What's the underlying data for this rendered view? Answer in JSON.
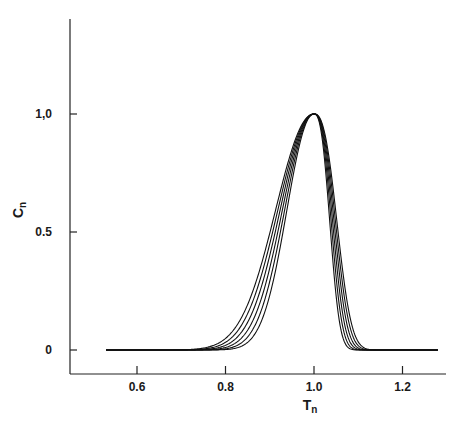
{
  "chart_data": {
    "type": "line",
    "title": "",
    "xlabel": "T",
    "xlabel_sub": "n",
    "ylabel": "C",
    "ylabel_sub": "n",
    "xlim": [
      0.45,
      1.28
    ],
    "ylim": [
      -0.1,
      1.4
    ],
    "grid": false,
    "legend": null,
    "x_ticks": [
      {
        "value": 0.6,
        "label": "0.6"
      },
      {
        "value": 0.8,
        "label": "0.8"
      },
      {
        "value": 1.0,
        "label": "1.0"
      },
      {
        "value": 1.2,
        "label": "1.2"
      }
    ],
    "y_ticks": [
      {
        "value": 0,
        "label": "0"
      },
      {
        "value": 0.5,
        "label": "0.5"
      },
      {
        "value": 1.0,
        "label": "1,0"
      }
    ],
    "x_range_of_curves": [
      0.53,
      1.28
    ],
    "peak": {
      "x": 1.0,
      "y": 1.0
    },
    "series": [
      {
        "name": "curve-1",
        "left_width": 0.085,
        "right_width": 0.048,
        "half_max_left": 0.93,
        "half_max_right": 1.052
      },
      {
        "name": "curve-2",
        "left_width": 0.08,
        "right_width": 0.045,
        "half_max_left": 0.934,
        "half_max_right": 1.048
      },
      {
        "name": "curve-3",
        "left_width": 0.075,
        "right_width": 0.042,
        "half_max_left": 0.938,
        "half_max_right": 1.045
      },
      {
        "name": "curve-4",
        "left_width": 0.07,
        "right_width": 0.039,
        "half_max_left": 0.942,
        "half_max_right": 1.041
      },
      {
        "name": "curve-5",
        "left_width": 0.065,
        "right_width": 0.036,
        "half_max_left": 0.946,
        "half_max_right": 1.038
      },
      {
        "name": "curve-6",
        "left_width": 0.06,
        "right_width": 0.033,
        "half_max_left": 0.95,
        "half_max_right": 1.035
      }
    ]
  },
  "colors": {
    "line": "#111111",
    "axis": "#222222",
    "background": "#ffffff"
  }
}
